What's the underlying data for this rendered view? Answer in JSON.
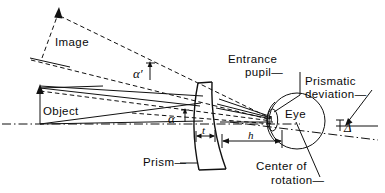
{
  "figure": {
    "background_color": "#ffffff",
    "line_color": "#111111",
    "width": 385,
    "height": 193
  },
  "labels": {
    "image": "Image",
    "object": "Object",
    "prism": "Prism—",
    "entrance_pupil_line1": "Entrance",
    "entrance_pupil_line2": "pupil—",
    "eye": "Eye",
    "prismatic_line1": "Prismatic",
    "prismatic_line2": "deviation—",
    "center_line1": "Center of",
    "center_line2": "rotation—",
    "alpha": "α",
    "alpha_prime": "α′",
    "thickness": "t",
    "distance": "h",
    "delta": "Δ"
  },
  "elements": {
    "optical_axis": "dash-dot horizontal reference axis",
    "object_arrow": "solid upward arrow at object plane",
    "image_arrow": "dashed upward arrow at image plane",
    "prism_body": "curved meniscus prism outline",
    "eye_circle": "eyeball circle",
    "cornea_arc": "cornea arc on left of eye",
    "entrance_pupil_ellipse": "small ellipse marking entrance pupil",
    "center_of_rotation_point": "center of rotation of the eye",
    "ray_bundle": "solid chief and marginal rays",
    "undeviated_rays": "dashed undeviated ray paths",
    "deviated_axis": "dash-dot deviated line through eye"
  }
}
